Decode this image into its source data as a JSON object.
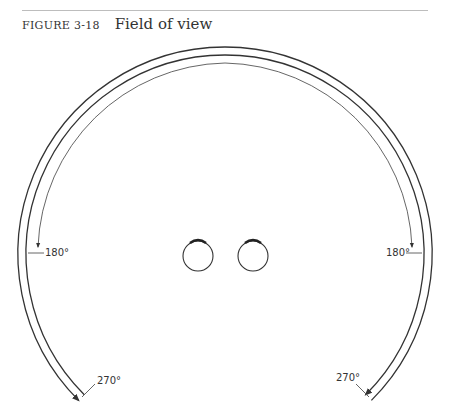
{
  "figure": {
    "number_label": "FIGURE 3-18",
    "title": "Field of view"
  },
  "diagram": {
    "labels": {
      "left_180": "180°",
      "right_180": "180°",
      "left_270": "270°",
      "right_270": "270°"
    },
    "elements": [
      "outer-arc-270",
      "middle-arc-270",
      "inner-arc-180",
      "left-eye",
      "right-eye"
    ],
    "line_color": "#333333"
  }
}
